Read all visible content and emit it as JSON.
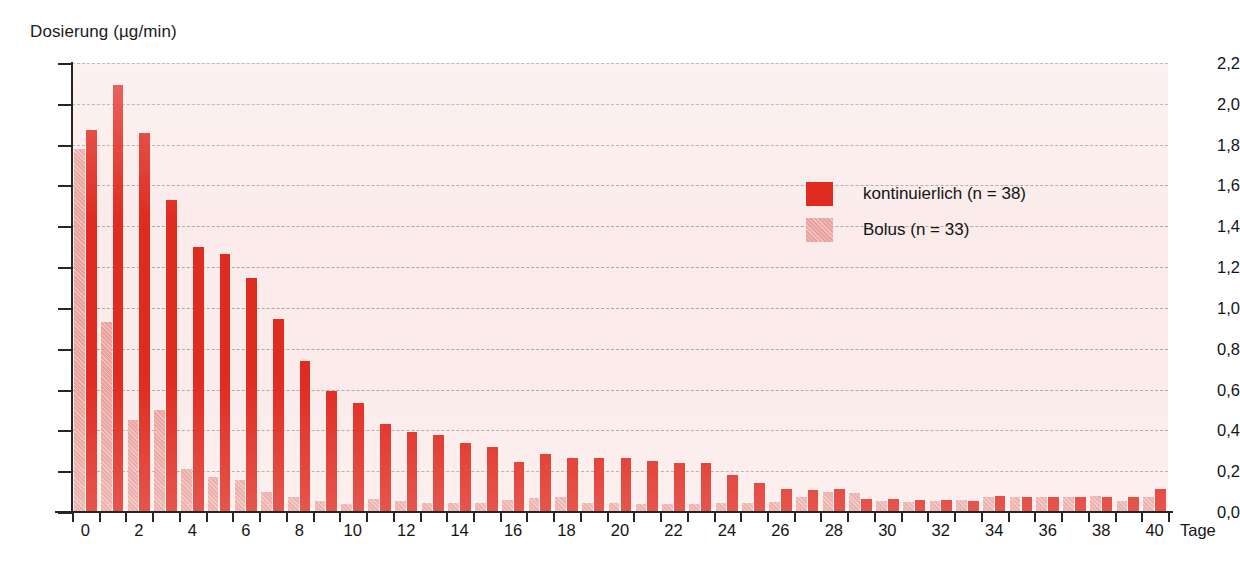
{
  "chart_data": {
    "type": "bar",
    "title": "",
    "ylabel": "Dosierung (µg/min)",
    "xlabel": "Tage",
    "ylim": [
      0.0,
      2.2
    ],
    "ytick_labels": [
      "0,0",
      "0,2",
      "0,4",
      "0,6",
      "0,8",
      "1,0",
      "1,2",
      "1,4",
      "1,6",
      "1,8",
      "2,0",
      "2,2"
    ],
    "ytick_values": [
      0.0,
      0.2,
      0.4,
      0.6,
      0.8,
      1.0,
      1.2,
      1.4,
      1.6,
      1.8,
      2.0,
      2.2
    ],
    "xtick_labels": [
      "0",
      "2",
      "4",
      "6",
      "8",
      "10",
      "12",
      "14",
      "16",
      "18",
      "20",
      "22",
      "24",
      "26",
      "28",
      "30",
      "32",
      "34",
      "36",
      "38",
      "40"
    ],
    "categories": [
      0,
      1,
      2,
      3,
      4,
      5,
      6,
      7,
      8,
      9,
      10,
      11,
      12,
      13,
      14,
      15,
      16,
      17,
      18,
      19,
      20,
      21,
      22,
      23,
      24,
      25,
      26,
      27,
      28,
      29,
      30,
      31,
      32,
      33,
      34,
      35,
      36,
      37,
      38,
      39,
      40
    ],
    "grid": true,
    "legend_position": "upper-right",
    "series": [
      {
        "name": "Bolus (n = 33)",
        "key": "bolus",
        "color": "#e8a19c",
        "values": [
          1.78,
          0.93,
          0.45,
          0.5,
          0.21,
          0.17,
          0.155,
          0.1,
          0.075,
          0.055,
          0.04,
          0.065,
          0.055,
          0.045,
          0.045,
          0.045,
          0.06,
          0.07,
          0.075,
          0.045,
          0.045,
          0.04,
          0.04,
          0.04,
          0.045,
          0.045,
          0.05,
          0.075,
          0.1,
          0.095,
          0.055,
          0.05,
          0.055,
          0.06,
          0.075,
          0.075,
          0.075,
          0.075,
          0.08,
          0.055,
          0.075
        ]
      },
      {
        "name": "kontinuierlich (n = 38)",
        "key": "kontinuierlich",
        "color": "#e02b20",
        "values": [
          1.87,
          2.09,
          1.855,
          1.53,
          1.3,
          1.265,
          1.145,
          0.945,
          0.74,
          0.595,
          0.535,
          0.43,
          0.39,
          0.375,
          0.34,
          0.32,
          0.245,
          0.285,
          0.265,
          0.265,
          0.265,
          0.25,
          0.24,
          0.24,
          0.18,
          0.14,
          0.115,
          0.11,
          0.115,
          0.065,
          0.065,
          0.06,
          0.06,
          0.055,
          0.08,
          0.075,
          0.075,
          0.075,
          0.075,
          0.075,
          0.115
        ]
      }
    ]
  },
  "legend": {
    "items": [
      {
        "label": "kontinuierlich (n = 38)",
        "key": "kontinuierlich"
      },
      {
        "label": "Bolus (n = 33)",
        "key": "bolus"
      }
    ]
  },
  "axes": {
    "y_title": "Dosierung (µg/min)",
    "x_title": "Tage"
  },
  "colors": {
    "kontinuierlich": "#e02b20",
    "bolus": "#e8a19c",
    "plot_background": "#fbeceb",
    "gridline": "#9a8f8f",
    "axis": "#262626",
    "text": "#141414"
  }
}
